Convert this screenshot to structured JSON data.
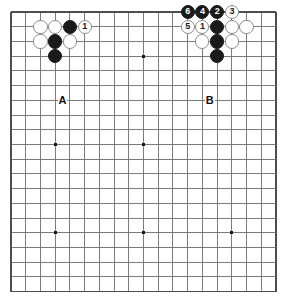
{
  "diagram": {
    "board": {
      "columns": 19,
      "rows": 20,
      "origin_x": 11,
      "origin_y": 12,
      "spacing": 14.72,
      "line_color": "#6e6e6e",
      "edge_color": "#4d4d4d",
      "background_color": "#ffffff",
      "star_point_color": "#1a1a1a",
      "star_points": [
        {
          "col": 3,
          "row": 9
        },
        {
          "col": 9,
          "row": 3
        },
        {
          "col": 9,
          "row": 9
        },
        {
          "col": 3,
          "row": 15
        },
        {
          "col": 9,
          "row": 15
        },
        {
          "col": 15,
          "row": 15
        }
      ]
    },
    "stones": [
      {
        "col": 2,
        "row": 1,
        "color": "white",
        "label": ""
      },
      {
        "col": 3,
        "row": 1,
        "color": "white",
        "label": ""
      },
      {
        "col": 4,
        "row": 1,
        "color": "black",
        "label": ""
      },
      {
        "col": 5,
        "row": 1,
        "color": "white",
        "label": "1"
      },
      {
        "col": 2,
        "row": 2,
        "color": "white",
        "label": ""
      },
      {
        "col": 3,
        "row": 2,
        "color": "black",
        "label": ""
      },
      {
        "col": 4,
        "row": 2,
        "color": "white",
        "label": ""
      },
      {
        "col": 3,
        "row": 3,
        "color": "black",
        "label": ""
      },
      {
        "col": 12,
        "row": 0,
        "color": "black",
        "label": "6"
      },
      {
        "col": 13,
        "row": 0,
        "color": "black",
        "label": "4"
      },
      {
        "col": 14,
        "row": 0,
        "color": "black",
        "label": "2"
      },
      {
        "col": 15,
        "row": 0,
        "color": "white",
        "label": "3"
      },
      {
        "col": 12,
        "row": 1,
        "color": "white",
        "label": "5"
      },
      {
        "col": 13,
        "row": 1,
        "color": "white",
        "label": "1"
      },
      {
        "col": 14,
        "row": 1,
        "color": "black",
        "label": ""
      },
      {
        "col": 15,
        "row": 1,
        "color": "white",
        "label": ""
      },
      {
        "col": 16,
        "row": 1,
        "color": "white",
        "label": ""
      },
      {
        "col": 13,
        "row": 2,
        "color": "white",
        "label": ""
      },
      {
        "col": 14,
        "row": 2,
        "color": "black",
        "label": ""
      },
      {
        "col": 15,
        "row": 2,
        "color": "white",
        "label": ""
      },
      {
        "col": 14,
        "row": 3,
        "color": "black",
        "label": ""
      }
    ],
    "markers": [
      {
        "col": 3.5,
        "row": 6,
        "text": "A"
      },
      {
        "col": 13.5,
        "row": 6,
        "text": "B"
      }
    ]
  }
}
